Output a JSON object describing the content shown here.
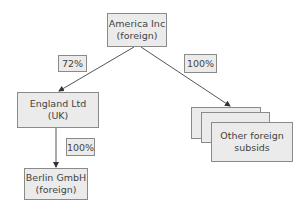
{
  "diagram": {
    "type": "ownership-structure",
    "nodes": {
      "parent": {
        "line1": "America Inc",
        "line2": "(foreign)"
      },
      "uk_sub": {
        "line1": "England Ltd (UK)"
      },
      "german_sub": {
        "line1": "Berlin GmbH",
        "line2": "(foreign)"
      },
      "other_subs": {
        "line1": "Other foreign",
        "line2": "subsids"
      }
    },
    "edges": {
      "parent_to_uk": {
        "label": "72%"
      },
      "parent_to_other": {
        "label": "100%"
      },
      "uk_to_german": {
        "label": "100%"
      }
    },
    "colors": {
      "box_fill": "#ebebeb",
      "box_border": "#8a8a8a",
      "line": "#555555"
    }
  }
}
